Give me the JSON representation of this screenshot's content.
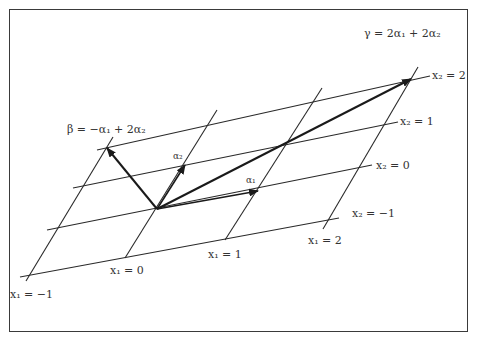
{
  "diagram": {
    "title": "",
    "vectors": {
      "alpha1": {
        "label": "α₁",
        "from": [
          157,
          209
        ],
        "to": [
          258,
          191
        ]
      },
      "alpha2": {
        "label": "α₂",
        "from": [
          157,
          209
        ],
        "to": [
          185,
          165
        ]
      },
      "beta": {
        "label": "β = −α₁ + 2α₂",
        "from": [
          157,
          209
        ],
        "to": [
          107,
          148
        ]
      },
      "gamma": {
        "label": "γ = 2α₁ + 2α₂",
        "from": [
          157,
          209
        ],
        "to": [
          411,
          79
        ]
      }
    },
    "x2_lines": [
      {
        "label": "x₂ = 2",
        "from": [
          97,
          150
        ],
        "to": [
          430,
          76
        ]
      },
      {
        "label": "x₂ = 1",
        "from": [
          73,
          188
        ],
        "to": [
          398,
          122
        ]
      },
      {
        "label": "x₂ = 0",
        "from": [
          47,
          230
        ],
        "to": [
          372,
          165
        ]
      },
      {
        "label": "x₂ = −1",
        "from": [
          20,
          277
        ],
        "to": [
          339,
          218
        ]
      }
    ],
    "x1_lines": [
      {
        "label": "x₁ = −1",
        "from": [
          26,
          281
        ],
        "to": [
          113,
          137
        ]
      },
      {
        "label": "x₁ = 0",
        "from": [
          125,
          258
        ],
        "to": [
          217,
          110
        ]
      },
      {
        "label": "x₁ = 1",
        "from": [
          225,
          240
        ],
        "to": [
          322,
          88
        ]
      },
      {
        "label": "x₁ = 2",
        "from": [
          323,
          229
        ],
        "to": [
          418,
          67
        ]
      }
    ],
    "colors": {
      "line": "#2a2a2a",
      "vector": "#1a1a1a",
      "frame": "#3a3a3a"
    }
  }
}
